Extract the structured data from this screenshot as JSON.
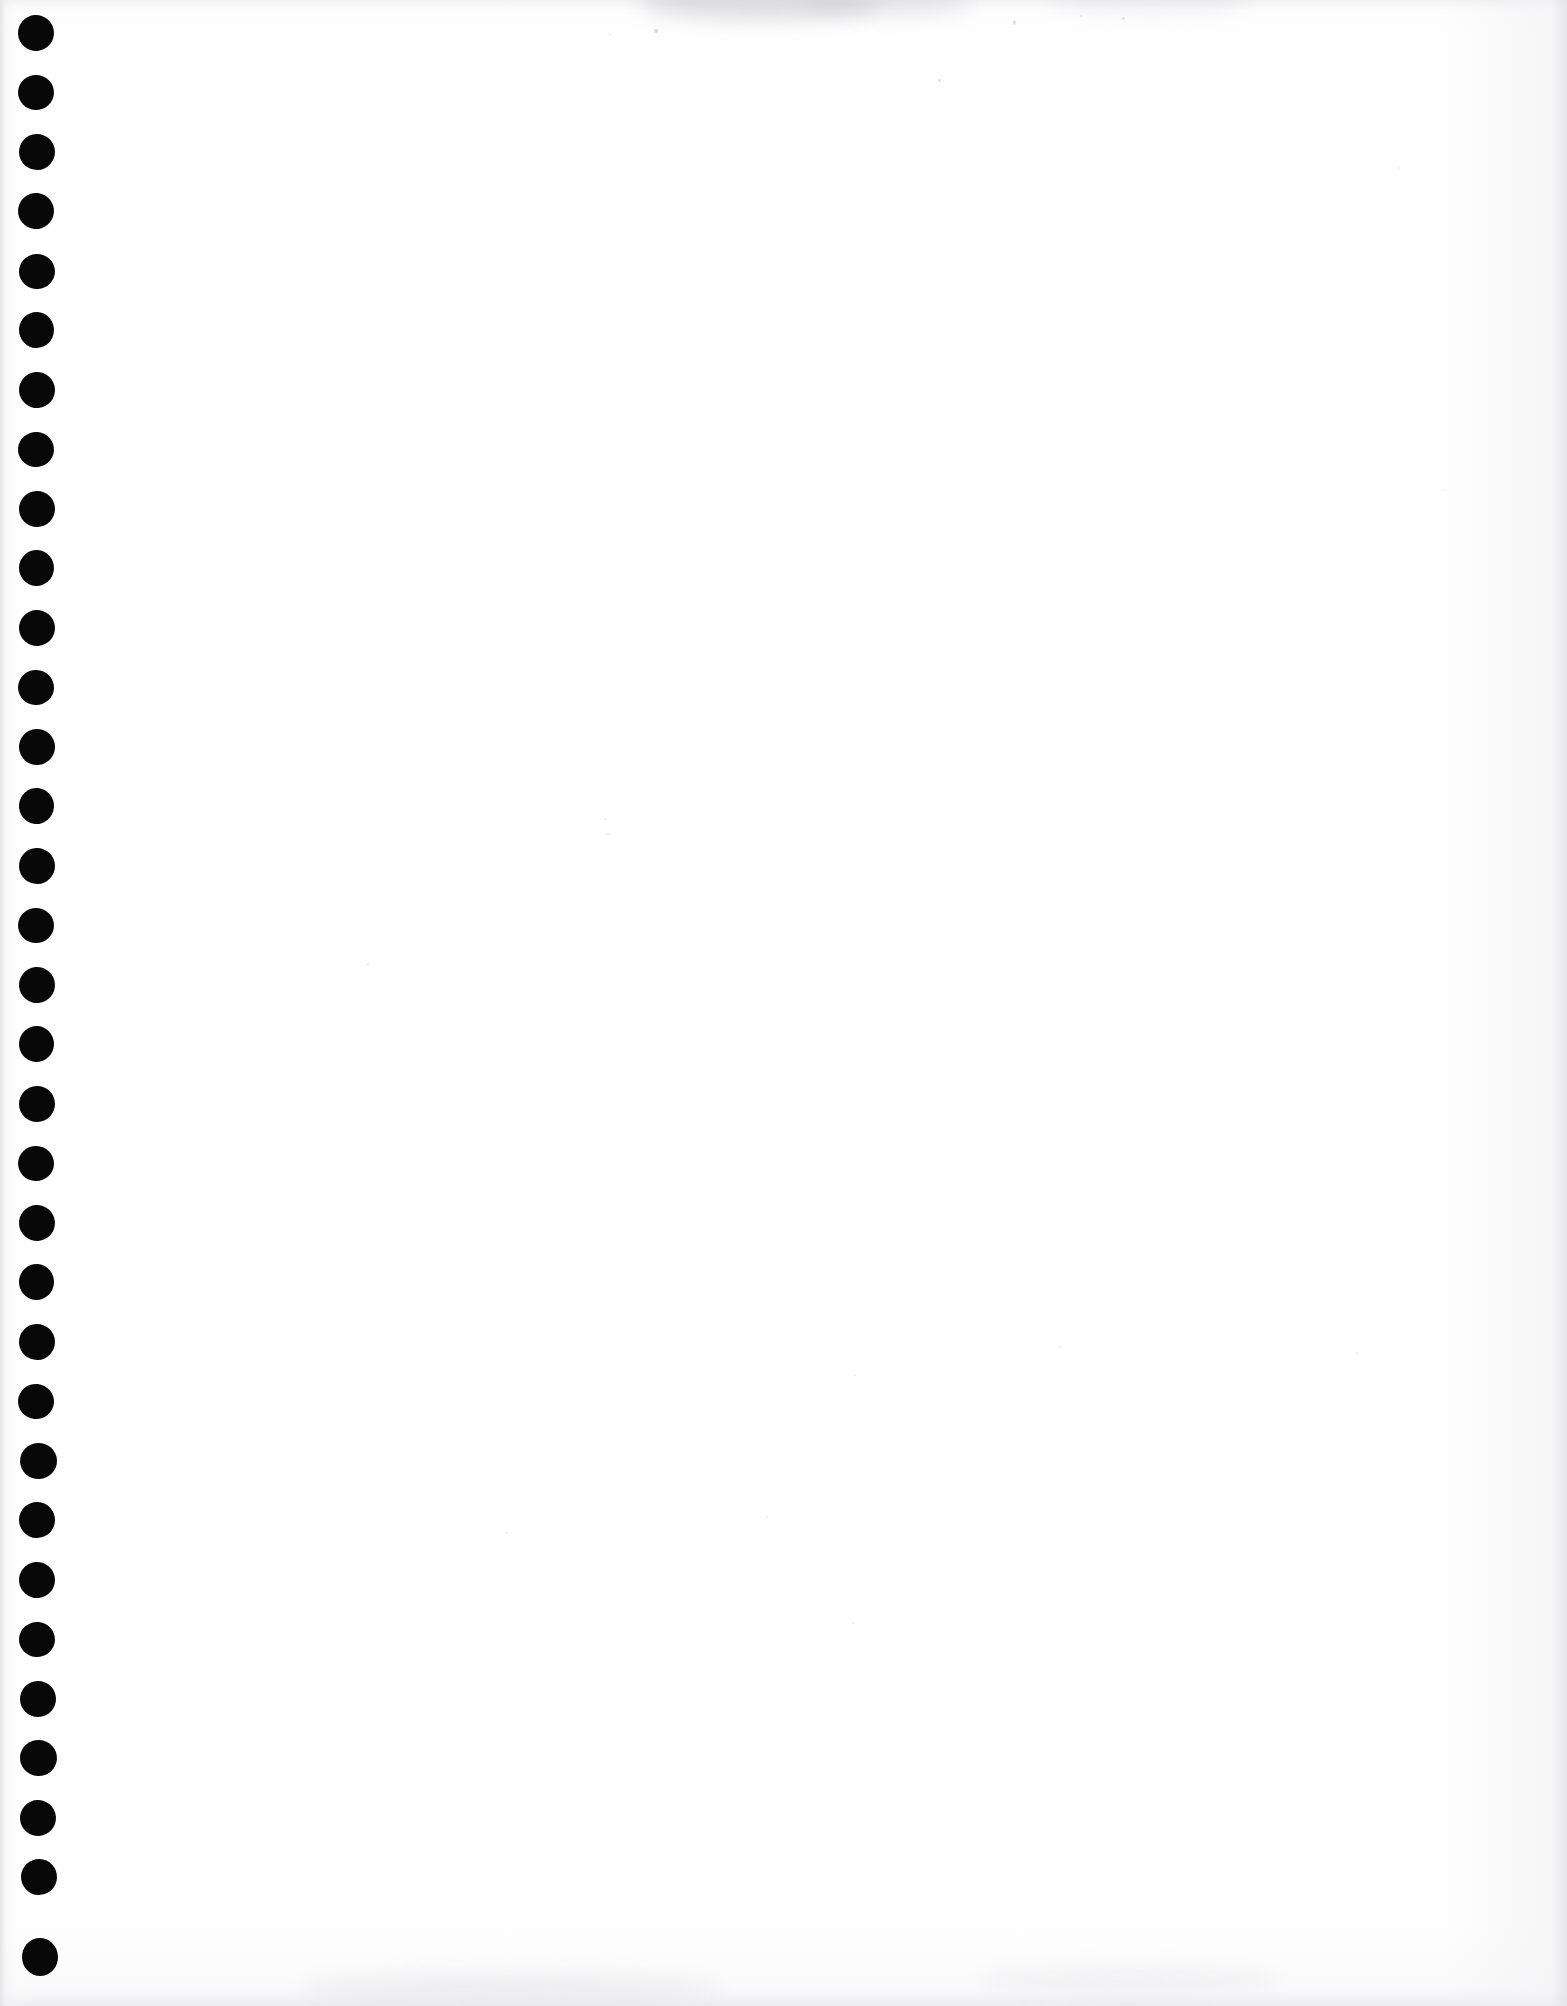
{
  "document": {
    "type": "scanned-page",
    "kind": "blank notebook sheet",
    "title": "",
    "visible_text": "",
    "page_width_px": 1567,
    "page_height_px": 2006,
    "background_color": "#fefefe",
    "ink_color": "#080808",
    "edge_shadow_color": "#e2e2e4"
  },
  "binding": {
    "name": "spiral-binding-punch-holes",
    "edge": "left",
    "hole_count": 33,
    "hole_color": "#080808",
    "hole_diameter_px": 35,
    "hole_center_x_px": 37,
    "first_hole_center_y_px": 33,
    "vertical_pitch_px": 59.5,
    "holes": [
      {
        "index": 1,
        "cx": 36,
        "cy": 33,
        "rx": 18,
        "ry": 18,
        "rot": -4
      },
      {
        "index": 2,
        "cx": 36,
        "cy": 92,
        "rx": 18,
        "ry": 17.5,
        "rot": 3
      },
      {
        "index": 3,
        "cx": 37,
        "cy": 152,
        "rx": 18,
        "ry": 18,
        "rot": -2
      },
      {
        "index": 4,
        "cx": 36,
        "cy": 211,
        "rx": 18,
        "ry": 18,
        "rot": 5
      },
      {
        "index": 5,
        "cx": 37,
        "cy": 271,
        "rx": 18,
        "ry": 17.5,
        "rot": -3
      },
      {
        "index": 6,
        "cx": 36,
        "cy": 330,
        "rx": 17.5,
        "ry": 18,
        "rot": 2
      },
      {
        "index": 7,
        "cx": 37,
        "cy": 390,
        "rx": 18,
        "ry": 18,
        "rot": -5
      },
      {
        "index": 8,
        "cx": 36,
        "cy": 449,
        "rx": 18,
        "ry": 17.5,
        "rot": 4
      },
      {
        "index": 9,
        "cx": 37,
        "cy": 509,
        "rx": 18,
        "ry": 18,
        "rot": -1
      },
      {
        "index": 10,
        "cx": 36,
        "cy": 568,
        "rx": 17.5,
        "ry": 18,
        "rot": 3
      },
      {
        "index": 11,
        "cx": 37,
        "cy": 628,
        "rx": 18,
        "ry": 18,
        "rot": -4
      },
      {
        "index": 12,
        "cx": 36,
        "cy": 687,
        "rx": 18,
        "ry": 17.5,
        "rot": 2
      },
      {
        "index": 13,
        "cx": 37,
        "cy": 747,
        "rx": 18,
        "ry": 18,
        "rot": -3
      },
      {
        "index": 14,
        "cx": 36,
        "cy": 806,
        "rx": 17.5,
        "ry": 18,
        "rot": 5
      },
      {
        "index": 15,
        "cx": 37,
        "cy": 866,
        "rx": 18,
        "ry": 18,
        "rot": -2
      },
      {
        "index": 16,
        "cx": 36,
        "cy": 925,
        "rx": 18,
        "ry": 17.5,
        "rot": 3
      },
      {
        "index": 17,
        "cx": 37,
        "cy": 985,
        "rx": 18,
        "ry": 18,
        "rot": -5
      },
      {
        "index": 18,
        "cx": 36,
        "cy": 1044,
        "rx": 17.5,
        "ry": 18,
        "rot": 4
      },
      {
        "index": 19,
        "cx": 37,
        "cy": 1104,
        "rx": 18,
        "ry": 18,
        "rot": -1
      },
      {
        "index": 20,
        "cx": 36,
        "cy": 1163,
        "rx": 18,
        "ry": 17.5,
        "rot": 2
      },
      {
        "index": 21,
        "cx": 37,
        "cy": 1223,
        "rx": 18,
        "ry": 18,
        "rot": -4
      },
      {
        "index": 22,
        "cx": 36,
        "cy": 1282,
        "rx": 17.5,
        "ry": 18,
        "rot": 3
      },
      {
        "index": 23,
        "cx": 37,
        "cy": 1342,
        "rx": 18,
        "ry": 18,
        "rot": -2
      },
      {
        "index": 24,
        "cx": 36,
        "cy": 1401,
        "rx": 18,
        "ry": 17.5,
        "rot": 5
      },
      {
        "index": 25,
        "cx": 38,
        "cy": 1461,
        "rx": 18.5,
        "ry": 18,
        "rot": -3
      },
      {
        "index": 26,
        "cx": 37,
        "cy": 1520,
        "rx": 18,
        "ry": 18,
        "rot": 2
      },
      {
        "index": 27,
        "cx": 37,
        "cy": 1580,
        "rx": 18,
        "ry": 18,
        "rot": -5
      },
      {
        "index": 28,
        "cx": 37,
        "cy": 1639,
        "rx": 18,
        "ry": 17.5,
        "rot": 4
      },
      {
        "index": 29,
        "cx": 38,
        "cy": 1699,
        "rx": 18,
        "ry": 18,
        "rot": -1
      },
      {
        "index": 30,
        "cx": 38,
        "cy": 1758,
        "rx": 18.5,
        "ry": 18,
        "rot": 3
      },
      {
        "index": 31,
        "cx": 38,
        "cy": 1818,
        "rx": 18,
        "ry": 18,
        "rot": -4
      },
      {
        "index": 32,
        "cx": 39,
        "cy": 1877,
        "rx": 18,
        "ry": 18,
        "rot": 2
      },
      {
        "index": 33,
        "cx": 40,
        "cy": 1957,
        "rx": 18,
        "ry": 19,
        "rot": -3
      }
    ]
  },
  "artifacts": {
    "name": "scan-dust-specks",
    "specks": [
      {
        "x": 654,
        "y": 29,
        "w": 4,
        "h": 4,
        "opacity": 0.55
      },
      {
        "x": 938,
        "y": 79,
        "w": 3,
        "h": 3,
        "opacity": 0.45
      },
      {
        "x": 1013,
        "y": 20,
        "w": 3,
        "h": 5,
        "opacity": 0.38
      },
      {
        "x": 1122,
        "y": 17,
        "w": 3,
        "h": 3,
        "opacity": 0.4
      },
      {
        "x": 609,
        "y": 33,
        "w": 2,
        "h": 2,
        "opacity": 0.35
      },
      {
        "x": 1080,
        "y": 15,
        "w": 2,
        "h": 2,
        "opacity": 0.3
      },
      {
        "x": 366,
        "y": 963,
        "w": 3,
        "h": 3,
        "opacity": 0.22
      },
      {
        "x": 604,
        "y": 818,
        "w": 3,
        "h": 2,
        "opacity": 0.18
      },
      {
        "x": 606,
        "y": 833,
        "w": 4,
        "h": 2,
        "opacity": 0.16
      },
      {
        "x": 854,
        "y": 1374,
        "w": 2,
        "h": 2,
        "opacity": 0.2
      },
      {
        "x": 505,
        "y": 1532,
        "w": 3,
        "h": 2,
        "opacity": 0.18
      },
      {
        "x": 766,
        "y": 1516,
        "w": 2,
        "h": 2,
        "opacity": 0.16
      },
      {
        "x": 1356,
        "y": 1352,
        "w": 2,
        "h": 2,
        "opacity": 0.16
      },
      {
        "x": 1059,
        "y": 1346,
        "w": 2,
        "h": 2,
        "opacity": 0.14
      },
      {
        "x": 852,
        "y": 1622,
        "w": 3,
        "h": 2,
        "opacity": 0.14
      },
      {
        "x": 1443,
        "y": 489,
        "w": 2,
        "h": 2,
        "opacity": 0.15
      },
      {
        "x": 1398,
        "y": 167,
        "w": 2,
        "h": 2,
        "opacity": 0.14
      }
    ]
  }
}
